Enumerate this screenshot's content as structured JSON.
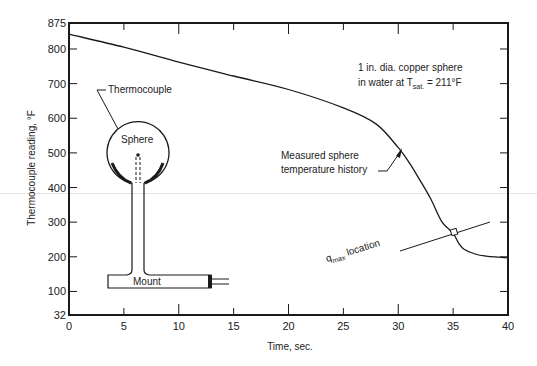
{
  "chart_data": {
    "type": "line",
    "title": "",
    "xlabel": "Time, sec.",
    "ylabel": "Thermocouple reading, °F",
    "xlim": [
      0,
      40
    ],
    "ylim": [
      32,
      875
    ],
    "x_ticks": [
      0,
      5,
      10,
      15,
      20,
      25,
      30,
      35,
      40
    ],
    "y_ticks": [
      32,
      100,
      200,
      300,
      400,
      500,
      600,
      700,
      800,
      875
    ],
    "grid": false,
    "series": [
      {
        "name": "Measured sphere temperature history",
        "x": [
          0,
          5,
          10,
          15,
          20,
          25,
          28,
          30,
          31,
          32,
          33,
          34,
          35,
          35.5,
          36,
          37,
          38,
          40
        ],
        "y": [
          843,
          805,
          762,
          722,
          683,
          630,
          583,
          515,
          472,
          420,
          365,
          300,
          268,
          240,
          222,
          208,
          202,
          197
        ]
      }
    ],
    "annotations": [
      {
        "text": "1 in. dia. copper sphere",
        "x": 27.5,
        "y": 775
      },
      {
        "text": "in water at T_sat. = 211°F",
        "x": 27.5,
        "y": 745
      },
      {
        "text": "Measured sphere temperature history",
        "x": 19,
        "y": 490,
        "arrow_to": [
          30.2,
          512
        ]
      },
      {
        "text": "q_max location",
        "x": 24,
        "y": 160,
        "points_to": [
          35.1,
          270
        ]
      },
      {
        "text": "Thermocouple",
        "x": 11.5,
        "y": 680
      },
      {
        "text": "Sphere",
        "x": 6.5,
        "y": 565
      },
      {
        "text": "Mount",
        "x": 8,
        "y": 130
      }
    ]
  },
  "labels": {
    "x_axis_title": "Time, sec.",
    "y_axis_title": "Thermocouple reading, °F",
    "note_line1": "1 in. dia. copper sphere",
    "note_line2_prefix": "in water at T",
    "note_line2_sub": "sat.",
    "note_line2_suffix": " = 211°F",
    "curve_label_line1": "Measured sphere",
    "curve_label_line2": "temperature history",
    "qmax_prefix": "q",
    "qmax_sub": "max",
    "qmax_suffix": " location",
    "thermocouple": "Thermocouple",
    "sphere": "Sphere",
    "mount": "Mount"
  },
  "x_tick_labels": [
    "0",
    "5",
    "10",
    "15",
    "20",
    "25",
    "30",
    "35",
    "40"
  ],
  "y_tick_labels": [
    "875",
    "800",
    "700",
    "600",
    "500",
    "400",
    "300",
    "200",
    "100",
    "32"
  ]
}
